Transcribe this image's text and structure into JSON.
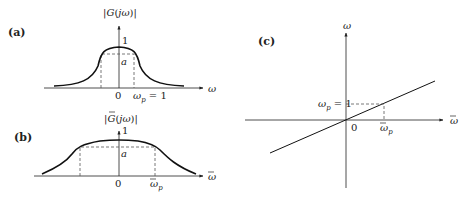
{
  "panels": {
    "a": {
      "tag": "(a)",
      "ylabel": "|G(jω)|",
      "xlabel": "ω",
      "peak_label": "1",
      "level_label": "a",
      "origin_label": "0",
      "cutoff_label": "ωp = 1",
      "cutoff_main": "ω",
      "cutoff_sub": "p",
      "cutoff_rest": " = 1"
    },
    "b": {
      "tag": "(b)",
      "ylabel": "|Ḡ(jω)|",
      "ylabel_main": "|G(jω)|",
      "xlabel": "ω̄",
      "peak_label": "1",
      "level_label": "a",
      "origin_label": "0",
      "cutoff_label": "ω̄p",
      "cutoff_main": "ω",
      "cutoff_sub": "p"
    },
    "c": {
      "tag": "(c)",
      "ylabel": "ω",
      "xlabel": "ω̄",
      "origin_label": "0",
      "y_point_label": "ωp = 1",
      "y_point_main": "ω",
      "y_point_sub": "p",
      "y_point_rest": " = 1",
      "x_point_label": "ω̄p",
      "x_point_main": "ω",
      "x_point_sub": "p"
    }
  },
  "colors": {
    "ink": "#222222",
    "dashed": "#555555"
  }
}
